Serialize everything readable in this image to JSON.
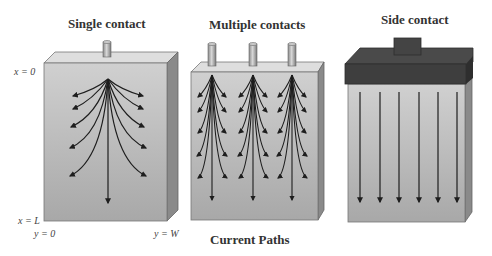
{
  "panels": [
    {
      "title": "Single contact",
      "contacts": 1,
      "type": "single"
    },
    {
      "title": "Multiple contacts",
      "contacts": 3,
      "type": "multiple"
    },
    {
      "title": "Side contact",
      "contacts": 1,
      "type": "side"
    }
  ],
  "axis_labels": {
    "x_top": "x = 0",
    "x_bottom": "x = L",
    "y_left": "y = 0",
    "y_right": "y = W"
  },
  "caption": "Current Paths",
  "colors": {
    "box_front": "#b8b8b8",
    "box_top": "#dcdcdc",
    "box_side": "#8a8a8a",
    "cap": "#3e3e3e",
    "arrow": "#1e1e1e"
  }
}
